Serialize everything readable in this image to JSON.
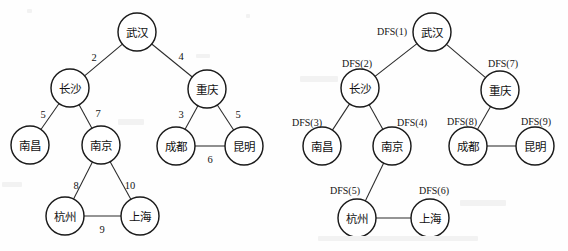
{
  "figure": {
    "background_color": "#fefefe",
    "ink_color": "#1a1a1a",
    "panels": [
      {
        "id": "weighted-graph",
        "name": "weighted-city-graph",
        "node_radius": 19,
        "nodes": [
          {
            "id": "wuhan",
            "label": "武汉",
            "x": 137,
            "y": 32
          },
          {
            "id": "changsha",
            "label": "长沙",
            "x": 70,
            "y": 88
          },
          {
            "id": "chongqing",
            "label": "重庆",
            "x": 207,
            "y": 89
          },
          {
            "id": "nanchang",
            "label": "南昌",
            "x": 30,
            "y": 145
          },
          {
            "id": "nanjing",
            "label": "南京",
            "x": 101,
            "y": 145
          },
          {
            "id": "chengdu",
            "label": "成都",
            "x": 176,
            "y": 146
          },
          {
            "id": "kunming",
            "label": "昆明",
            "x": 244,
            "y": 146
          },
          {
            "id": "hangzhou",
            "label": "杭州",
            "x": 65,
            "y": 216
          },
          {
            "id": "shanghai",
            "label": "上海",
            "x": 140,
            "y": 216
          }
        ],
        "edges": [
          {
            "from": "wuhan",
            "to": "changsha",
            "weight": "2",
            "lx": 94,
            "ly": 57
          },
          {
            "from": "wuhan",
            "to": "chongqing",
            "weight": "4",
            "lx": 181,
            "ly": 56
          },
          {
            "from": "changsha",
            "to": "nanchang",
            "weight": "5",
            "lx": 43,
            "ly": 114
          },
          {
            "from": "changsha",
            "to": "nanjing",
            "weight": "7",
            "lx": 98,
            "ly": 113
          },
          {
            "from": "chongqing",
            "to": "chengdu",
            "weight": "3",
            "lx": 181,
            "ly": 114
          },
          {
            "from": "chongqing",
            "to": "kunming",
            "weight": "5",
            "lx": 238,
            "ly": 114
          },
          {
            "from": "chengdu",
            "to": "kunming",
            "weight": "6",
            "lx": 210,
            "ly": 159
          },
          {
            "from": "nanjing",
            "to": "hangzhou",
            "weight": "8",
            "lx": 76,
            "ly": 185
          },
          {
            "from": "nanjing",
            "to": "shanghai",
            "weight": "10",
            "lx": 130,
            "ly": 185
          },
          {
            "from": "hangzhou",
            "to": "shanghai",
            "weight": "9",
            "lx": 102,
            "ly": 229
          }
        ]
      },
      {
        "id": "dfs-order-graph",
        "name": "dfs-traversal-graph",
        "node_radius": 19,
        "nodes": [
          {
            "id": "wuhan",
            "label": "武汉",
            "x": 432,
            "y": 32,
            "dfs": "DFS(1)",
            "dx": 392,
            "dy": 31
          },
          {
            "id": "changsha",
            "label": "长沙",
            "x": 360,
            "y": 88,
            "dfs": "DFS(2)",
            "dx": 357,
            "dy": 63
          },
          {
            "id": "chongqing",
            "label": "重庆",
            "x": 500,
            "y": 90,
            "dfs": "DFS(7)",
            "dx": 503,
            "dy": 63
          },
          {
            "id": "nanchang",
            "label": "南昌",
            "x": 322,
            "y": 146,
            "dfs": "DFS(3)",
            "dx": 307,
            "dy": 122
          },
          {
            "id": "nanjing",
            "label": "南京",
            "x": 392,
            "y": 146,
            "dfs": "DFS(4)",
            "dx": 412,
            "dy": 122
          },
          {
            "id": "chengdu",
            "label": "成都",
            "x": 468,
            "y": 146,
            "dfs": "DFS(8)",
            "dx": 462,
            "dy": 121
          },
          {
            "id": "kunming",
            "label": "昆明",
            "x": 535,
            "y": 146,
            "dfs": "DFS(9)",
            "dx": 536,
            "dy": 121
          },
          {
            "id": "hangzhou",
            "label": "杭州",
            "x": 357,
            "y": 218,
            "dfs": "DFS(5)",
            "dx": 345,
            "dy": 190
          },
          {
            "id": "shanghai",
            "label": "上海",
            "x": 430,
            "y": 218,
            "dfs": "DFS(6)",
            "dx": 434,
            "dy": 190
          }
        ],
        "edges": [
          {
            "from": "wuhan",
            "to": "changsha"
          },
          {
            "from": "wuhan",
            "to": "chongqing"
          },
          {
            "from": "changsha",
            "to": "nanchang"
          },
          {
            "from": "changsha",
            "to": "nanjing"
          },
          {
            "from": "chongqing",
            "to": "chengdu"
          },
          {
            "from": "nanjing",
            "to": "hangzhou"
          },
          {
            "from": "chengdu",
            "to": "kunming"
          },
          {
            "from": "hangzhou",
            "to": "shanghai"
          }
        ]
      }
    ]
  }
}
